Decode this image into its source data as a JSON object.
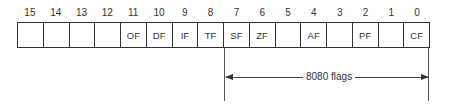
{
  "diagram": {
    "bits": [
      {
        "num": "15",
        "flag": ""
      },
      {
        "num": "14",
        "flag": ""
      },
      {
        "num": "13",
        "flag": ""
      },
      {
        "num": "12",
        "flag": ""
      },
      {
        "num": "11",
        "flag": "OF"
      },
      {
        "num": "10",
        "flag": "DF"
      },
      {
        "num": "9",
        "flag": "IF"
      },
      {
        "num": "8",
        "flag": "TF"
      },
      {
        "num": "7",
        "flag": "SF"
      },
      {
        "num": "6",
        "flag": "ZF"
      },
      {
        "num": "5",
        "flag": ""
      },
      {
        "num": "4",
        "flag": "AF"
      },
      {
        "num": "3",
        "flag": ""
      },
      {
        "num": "2",
        "flag": "PF"
      },
      {
        "num": "1",
        "flag": ""
      },
      {
        "num": "0",
        "flag": "CF"
      }
    ],
    "span_label": "8080 flags",
    "span_range": [
      "7",
      "0"
    ]
  }
}
